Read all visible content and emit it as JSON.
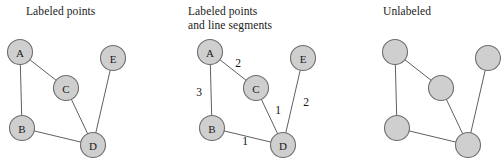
{
  "figure": {
    "width": 501,
    "height": 165,
    "background_color": "#ffffff",
    "node_fill_color": "#cfcfcf",
    "node_stroke_color": "#6e6e6e",
    "edge_color": "#4d4d4d",
    "text_color": "#1a1a1a"
  },
  "panels": [
    {
      "id": "labeled",
      "title": "Labeled points",
      "show_node_labels": true,
      "show_edge_weights": false
    },
    {
      "id": "weighted",
      "title_line1": "Labeled points",
      "title_line2": "and line segments",
      "title": "Labeled points and line segments",
      "show_node_labels": true,
      "show_edge_weights": true
    },
    {
      "id": "unlabeled",
      "title": "Unlabeled",
      "show_node_labels": false,
      "show_edge_weights": false
    }
  ],
  "graph": {
    "node_radius": 12.5,
    "nodes": [
      {
        "id": "A",
        "label": "A",
        "x": 20,
        "y": 52
      },
      {
        "id": "B",
        "label": "B",
        "x": 22,
        "y": 128
      },
      {
        "id": "C",
        "label": "C",
        "x": 66,
        "y": 88
      },
      {
        "id": "D",
        "label": "D",
        "x": 93,
        "y": 145
      },
      {
        "id": "E",
        "label": "E",
        "x": 113,
        "y": 58
      }
    ],
    "edges": [
      {
        "from": "A",
        "to": "C",
        "weight": "2",
        "label_x": 48,
        "label_y": 63
      },
      {
        "from": "A",
        "to": "B",
        "weight": "3",
        "label_x": 9,
        "label_y": 92
      },
      {
        "from": "C",
        "to": "D",
        "weight": "1",
        "label_x": 88,
        "label_y": 110
      },
      {
        "from": "B",
        "to": "D",
        "weight": "1",
        "label_x": 55,
        "label_y": 141
      },
      {
        "from": "E",
        "to": "D",
        "weight": "2",
        "label_x": 116,
        "label_y": 102
      }
    ]
  },
  "panel_offsets": {
    "labeled": 0,
    "weighted": 20,
    "unlabeled": 40
  }
}
